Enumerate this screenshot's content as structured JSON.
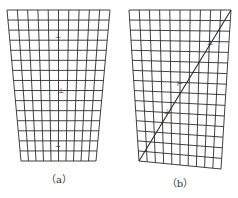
{
  "figure": {
    "panels": [
      {
        "id": "a",
        "caption": "（a）",
        "grid": {
          "cols": 10,
          "rows": 15,
          "top_left": [
            7,
            10
          ],
          "top_right": [
            110,
            10
          ],
          "bottom_left": [
            21,
            161
          ],
          "bottom_right": [
            96,
            161
          ]
        },
        "markers": [
          {
            "x": 58,
            "y": 38,
            "glyph": "⊥"
          },
          {
            "x": 61,
            "y": 93,
            "glyph": "⊥"
          },
          {
            "x": 58,
            "y": 147,
            "glyph": "⊥"
          }
        ],
        "diagonal": null
      },
      {
        "id": "b",
        "caption": "（b）",
        "grid": {
          "cols": 10,
          "rows": 15,
          "top_left": [
            129,
            10
          ],
          "top_right": [
            231,
            10
          ],
          "bottom_left": [
            139,
            161
          ],
          "bottom_right": [
            221,
            169
          ]
        },
        "markers": [
          {
            "x": 210,
            "y": 45,
            "glyph": "⊥"
          },
          {
            "x": 180,
            "y": 86,
            "glyph": "⊢"
          },
          {
            "x": 167,
            "y": 114,
            "glyph": "⊥"
          }
        ],
        "diagonal": {
          "from": [
            139,
            161
          ],
          "to": [
            231,
            10
          ]
        }
      }
    ],
    "line_color": "#2b2b2b"
  }
}
